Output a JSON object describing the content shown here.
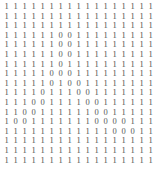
{
  "panel": {
    "title": "Binary Matrix",
    "background_color": "#ffffff",
    "digit_color": "#4a4a4a",
    "rows_count": 17,
    "columns_count": 17
  },
  "chart_data": {
    "type": "heatmap",
    "xlabel": "",
    "ylabel": "",
    "rows": 17,
    "columns": 17,
    "value_labels": [
      "0",
      "1"
    ],
    "grid": [
      [
        "1",
        "1",
        "1",
        "1",
        "1",
        "1",
        "1",
        "1",
        "1",
        "1",
        "1",
        "1",
        "1",
        "1",
        "1",
        "1",
        "1"
      ],
      [
        "1",
        "1",
        "1",
        "1",
        "1",
        "1",
        "1",
        "1",
        "1",
        "1",
        "1",
        "1",
        "1",
        "1",
        "1",
        "1",
        "1"
      ],
      [
        "1",
        "1",
        "1",
        "1",
        "1",
        "1",
        "1",
        "1",
        "1",
        "1",
        "1",
        "1",
        "1",
        "1",
        "1",
        "1",
        "1"
      ],
      [
        "1",
        "1",
        "1",
        "1",
        "1",
        "1",
        "0",
        "0",
        "1",
        "1",
        "1",
        "1",
        "1",
        "1",
        "1",
        "1",
        "1"
      ],
      [
        "1",
        "1",
        "1",
        "1",
        "1",
        "1",
        "0",
        "0",
        "1",
        "1",
        "1",
        "1",
        "1",
        "1",
        "1",
        "1",
        "1"
      ],
      [
        "1",
        "1",
        "1",
        "1",
        "1",
        "1",
        "0",
        "0",
        "1",
        "1",
        "1",
        "1",
        "1",
        "1",
        "1",
        "1",
        "1"
      ],
      [
        "1",
        "1",
        "1",
        "1",
        "1",
        "1",
        "0",
        "1",
        "1",
        "1",
        "1",
        "1",
        "1",
        "1",
        "1",
        "1",
        "1"
      ],
      [
        "1",
        "1",
        "1",
        "1",
        "1",
        "0",
        "0",
        "0",
        "1",
        "1",
        "1",
        "1",
        "1",
        "1",
        "1",
        "1",
        "1"
      ],
      [
        "1",
        "1",
        "1",
        "1",
        "1",
        "0",
        "1",
        "0",
        "0",
        "1",
        "1",
        "1",
        "1",
        "1",
        "1",
        "1",
        "1"
      ],
      [
        "1",
        "1",
        "1",
        "1",
        "0",
        "1",
        "1",
        "1",
        "0",
        "0",
        "1",
        "1",
        "1",
        "1",
        "1",
        "1",
        "1"
      ],
      [
        "1",
        "1",
        "1",
        "0",
        "0",
        "1",
        "1",
        "1",
        "1",
        "0",
        "0",
        "1",
        "1",
        "1",
        "1",
        "1",
        "1"
      ],
      [
        "1",
        "1",
        "0",
        "0",
        "1",
        "1",
        "1",
        "1",
        "1",
        "1",
        "0",
        "0",
        "1",
        "1",
        "1",
        "1",
        "1"
      ],
      [
        "1",
        "0",
        "0",
        "1",
        "1",
        "1",
        "1",
        "1",
        "1",
        "1",
        "0",
        "0",
        "0",
        "0",
        "1",
        "1",
        "1"
      ],
      [
        "1",
        "1",
        "1",
        "1",
        "1",
        "1",
        "1",
        "1",
        "1",
        "1",
        "1",
        "1",
        "0",
        "0",
        "0",
        "1",
        "1"
      ],
      [
        "1",
        "1",
        "1",
        "1",
        "1",
        "1",
        "1",
        "1",
        "1",
        "1",
        "1",
        "1",
        "1",
        "1",
        "1",
        "1",
        "1"
      ],
      [
        "1",
        "1",
        "1",
        "1",
        "1",
        "1",
        "1",
        "1",
        "1",
        "1",
        "1",
        "1",
        "1",
        "1",
        "1",
        "1",
        "1"
      ],
      [
        "1",
        "1",
        "1",
        "1",
        "1",
        "1",
        "1",
        "1",
        "1",
        "1",
        "1",
        "1",
        "1",
        "1",
        "1",
        "1",
        "1"
      ]
    ]
  }
}
